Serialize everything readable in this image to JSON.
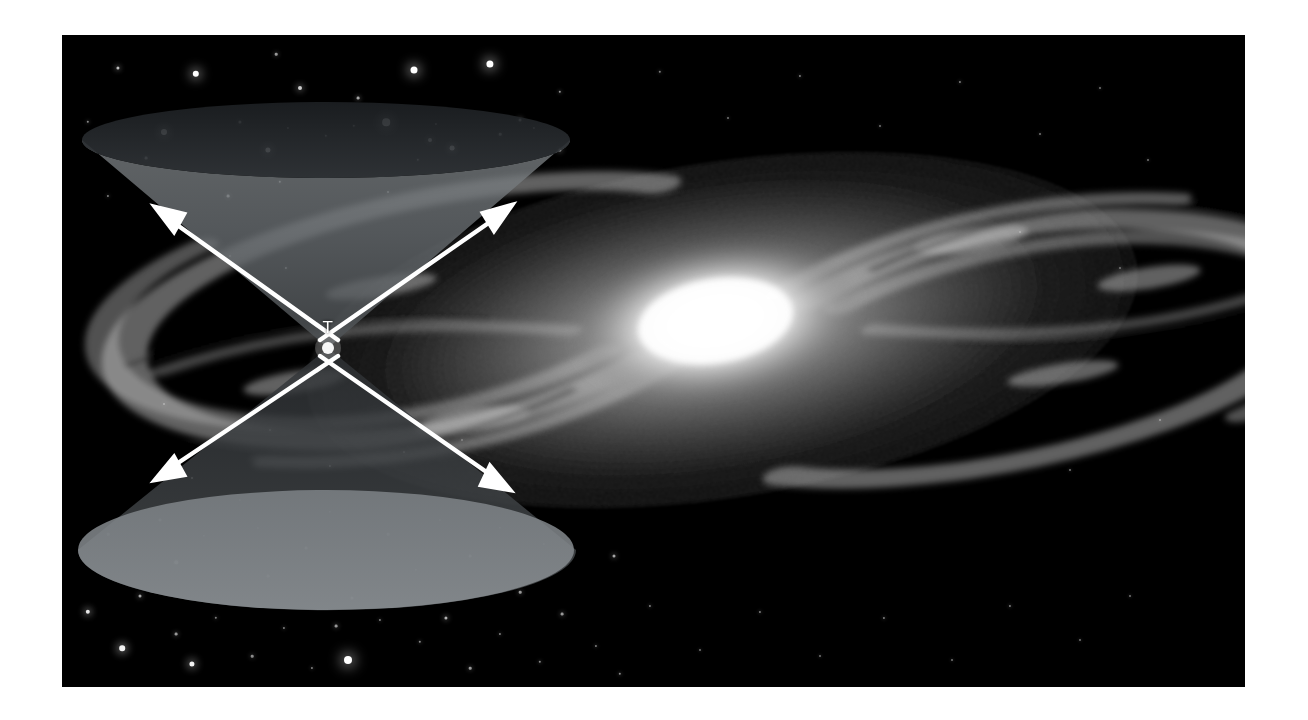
{
  "figure": {
    "kind": "astronomy-illustration",
    "background_color": "#ffffff",
    "plate_color": "#000000",
    "caption_text": "",
    "vertex_label": "T",
    "cone_label_color": "#ffffff",
    "plate": {
      "x": 62,
      "y": 35,
      "width": 1183,
      "height": 652
    }
  },
  "chart_data": {
    "type": "diagram",
    "subtitle": "",
    "xlabel": "",
    "ylabel": "",
    "grid": false,
    "legend_position": "none",
    "annotations": [
      {
        "text": "T",
        "x": 328,
        "y": 327,
        "role": "event-vertex-label"
      }
    ],
    "elements": [
      {
        "name": "future-light-cone",
        "kind": "cone",
        "orientation": "up",
        "apex": [
          328,
          348
        ],
        "rim_center": [
          326,
          140
        ],
        "rim_rx": 244,
        "rim_ry": 38,
        "wall_fill": "#6e7377",
        "interior_fill": "#2a2d31"
      },
      {
        "name": "past-light-cone",
        "kind": "cone",
        "orientation": "down",
        "apex": [
          328,
          348
        ],
        "rim_center": [
          326,
          550
        ],
        "rim_rx": 248,
        "rim_ry": 60,
        "wall_fill": "#3a3e42",
        "interior_fill": "#7b8085"
      },
      {
        "name": "spiral-galaxy",
        "kind": "spiral-galaxy",
        "center": [
          660,
          295
        ],
        "disk_rx": 460,
        "disk_ry": 175,
        "core_rx": 120,
        "core_ry": 62,
        "tilt_deg": -9,
        "arm_count": 4,
        "core_color": "#ffffff",
        "disk_color": "#b8b8b8"
      }
    ],
    "arrows": [
      {
        "name": "upper-left-ray",
        "from": [
          328,
          348
        ],
        "to": [
          155,
          207
        ],
        "color": "#ffffff"
      },
      {
        "name": "upper-right-ray",
        "from": [
          328,
          348
        ],
        "to": [
          510,
          205
        ],
        "color": "#ffffff"
      },
      {
        "name": "lower-left-ray",
        "from": [
          328,
          348
        ],
        "to": [
          155,
          478
        ],
        "color": "#ffffff"
      },
      {
        "name": "lower-right-ray",
        "from": [
          328,
          348
        ],
        "to": [
          508,
          490
        ],
        "color": "#ffffff"
      }
    ],
    "stars": [
      {
        "x": 118,
        "y": 68,
        "r": 1.6,
        "b": 0.75
      },
      {
        "x": 196,
        "y": 74,
        "r": 3.2,
        "b": 1.0
      },
      {
        "x": 276,
        "y": 54,
        "r": 1.3,
        "b": 0.6
      },
      {
        "x": 300,
        "y": 88,
        "r": 2.0,
        "b": 0.8
      },
      {
        "x": 358,
        "y": 98,
        "r": 1.4,
        "b": 0.65
      },
      {
        "x": 414,
        "y": 70,
        "r": 3.5,
        "b": 1.0
      },
      {
        "x": 430,
        "y": 140,
        "r": 2.0,
        "b": 0.8
      },
      {
        "x": 490,
        "y": 64,
        "r": 3.6,
        "b": 1.0
      },
      {
        "x": 520,
        "y": 120,
        "r": 1.5,
        "b": 0.7
      },
      {
        "x": 560,
        "y": 92,
        "r": 1.2,
        "b": 0.6
      },
      {
        "x": 88,
        "y": 122,
        "r": 1.2,
        "b": 0.55
      },
      {
        "x": 146,
        "y": 158,
        "r": 1.4,
        "b": 0.6
      },
      {
        "x": 164,
        "y": 132,
        "r": 3.0,
        "b": 1.0
      },
      {
        "x": 240,
        "y": 122,
        "r": 1.6,
        "b": 0.7
      },
      {
        "x": 268,
        "y": 150,
        "r": 2.6,
        "b": 0.95
      },
      {
        "x": 288,
        "y": 128,
        "r": 1.1,
        "b": 0.5
      },
      {
        "x": 326,
        "y": 136,
        "r": 1.2,
        "b": 0.55
      },
      {
        "x": 354,
        "y": 126,
        "r": 1.2,
        "b": 0.55
      },
      {
        "x": 386,
        "y": 122,
        "r": 3.8,
        "b": 1.0
      },
      {
        "x": 418,
        "y": 160,
        "r": 1.2,
        "b": 0.55
      },
      {
        "x": 436,
        "y": 124,
        "r": 1.1,
        "b": 0.5
      },
      {
        "x": 452,
        "y": 148,
        "r": 2.4,
        "b": 0.9
      },
      {
        "x": 500,
        "y": 134,
        "r": 1.3,
        "b": 0.6
      },
      {
        "x": 534,
        "y": 128,
        "r": 1.1,
        "b": 0.5
      },
      {
        "x": 560,
        "y": 150,
        "r": 1.6,
        "b": 0.7
      },
      {
        "x": 108,
        "y": 196,
        "r": 1.1,
        "b": 0.5
      },
      {
        "x": 228,
        "y": 196,
        "r": 1.4,
        "b": 0.6
      },
      {
        "x": 280,
        "y": 182,
        "r": 1.2,
        "b": 0.55
      },
      {
        "x": 388,
        "y": 192,
        "r": 1.0,
        "b": 0.45
      },
      {
        "x": 230,
        "y": 256,
        "r": 1.0,
        "b": 0.45
      },
      {
        "x": 286,
        "y": 268,
        "r": 1.1,
        "b": 0.5
      },
      {
        "x": 164,
        "y": 404,
        "r": 1.0,
        "b": 0.45
      },
      {
        "x": 270,
        "y": 430,
        "r": 1.0,
        "b": 0.45
      },
      {
        "x": 192,
        "y": 478,
        "r": 1.0,
        "b": 0.45
      },
      {
        "x": 240,
        "y": 500,
        "r": 1.1,
        "b": 0.5
      },
      {
        "x": 330,
        "y": 466,
        "r": 1.1,
        "b": 0.5
      },
      {
        "x": 404,
        "y": 452,
        "r": 1.0,
        "b": 0.45
      },
      {
        "x": 462,
        "y": 440,
        "r": 1.0,
        "b": 0.45
      },
      {
        "x": 108,
        "y": 534,
        "r": 1.3,
        "b": 0.6
      },
      {
        "x": 160,
        "y": 520,
        "r": 1.5,
        "b": 0.7
      },
      {
        "x": 176,
        "y": 562,
        "r": 1.8,
        "b": 0.8
      },
      {
        "x": 204,
        "y": 536,
        "r": 1.2,
        "b": 0.55
      },
      {
        "x": 258,
        "y": 528,
        "r": 1.1,
        "b": 0.5
      },
      {
        "x": 268,
        "y": 576,
        "r": 1.4,
        "b": 0.6
      },
      {
        "x": 306,
        "y": 548,
        "r": 1.4,
        "b": 0.65
      },
      {
        "x": 330,
        "y": 512,
        "r": 1.2,
        "b": 0.55
      },
      {
        "x": 352,
        "y": 598,
        "r": 1.6,
        "b": 0.7
      },
      {
        "x": 388,
        "y": 534,
        "r": 1.3,
        "b": 0.6
      },
      {
        "x": 416,
        "y": 570,
        "r": 1.2,
        "b": 0.55
      },
      {
        "x": 440,
        "y": 520,
        "r": 1.1,
        "b": 0.5
      },
      {
        "x": 470,
        "y": 556,
        "r": 1.4,
        "b": 0.65
      },
      {
        "x": 500,
        "y": 528,
        "r": 1.2,
        "b": 0.55
      },
      {
        "x": 520,
        "y": 592,
        "r": 1.3,
        "b": 0.6
      },
      {
        "x": 544,
        "y": 544,
        "r": 1.1,
        "b": 0.5
      },
      {
        "x": 88,
        "y": 612,
        "r": 2.2,
        "b": 0.9
      },
      {
        "x": 122,
        "y": 648,
        "r": 2.8,
        "b": 0.95
      },
      {
        "x": 140,
        "y": 596,
        "r": 1.5,
        "b": 0.65
      },
      {
        "x": 176,
        "y": 634,
        "r": 1.4,
        "b": 0.6
      },
      {
        "x": 192,
        "y": 664,
        "r": 2.6,
        "b": 0.95
      },
      {
        "x": 216,
        "y": 618,
        "r": 1.2,
        "b": 0.5
      },
      {
        "x": 252,
        "y": 656,
        "r": 1.3,
        "b": 0.55
      },
      {
        "x": 284,
        "y": 628,
        "r": 1.1,
        "b": 0.5
      },
      {
        "x": 312,
        "y": 668,
        "r": 1.1,
        "b": 0.5
      },
      {
        "x": 336,
        "y": 626,
        "r": 1.4,
        "b": 0.6
      },
      {
        "x": 348,
        "y": 660,
        "r": 4.0,
        "b": 1.0
      },
      {
        "x": 380,
        "y": 620,
        "r": 1.1,
        "b": 0.5
      },
      {
        "x": 420,
        "y": 642,
        "r": 1.2,
        "b": 0.55
      },
      {
        "x": 446,
        "y": 618,
        "r": 1.6,
        "b": 0.7
      },
      {
        "x": 470,
        "y": 668,
        "r": 1.3,
        "b": 0.6
      },
      {
        "x": 500,
        "y": 634,
        "r": 1.1,
        "b": 0.5
      },
      {
        "x": 540,
        "y": 662,
        "r": 1.2,
        "b": 0.55
      },
      {
        "x": 562,
        "y": 614,
        "r": 1.4,
        "b": 0.6
      },
      {
        "x": 596,
        "y": 646,
        "r": 1.1,
        "b": 0.5
      },
      {
        "x": 620,
        "y": 674,
        "r": 1.2,
        "b": 0.55
      },
      {
        "x": 614,
        "y": 556,
        "r": 1.5,
        "b": 0.65
      },
      {
        "x": 650,
        "y": 606,
        "r": 1.1,
        "b": 0.5
      },
      {
        "x": 700,
        "y": 650,
        "r": 1.0,
        "b": 0.45
      },
      {
        "x": 760,
        "y": 612,
        "r": 1.1,
        "b": 0.5
      },
      {
        "x": 820,
        "y": 656,
        "r": 1.0,
        "b": 0.45
      },
      {
        "x": 884,
        "y": 618,
        "r": 1.1,
        "b": 0.5
      },
      {
        "x": 952,
        "y": 660,
        "r": 1.0,
        "b": 0.45
      },
      {
        "x": 1010,
        "y": 606,
        "r": 1.1,
        "b": 0.5
      },
      {
        "x": 1080,
        "y": 640,
        "r": 1.0,
        "b": 0.45
      },
      {
        "x": 1130,
        "y": 596,
        "r": 1.0,
        "b": 0.45
      },
      {
        "x": 660,
        "y": 72,
        "r": 1.2,
        "b": 0.5
      },
      {
        "x": 728,
        "y": 118,
        "r": 1.0,
        "b": 0.45
      },
      {
        "x": 800,
        "y": 76,
        "r": 1.1,
        "b": 0.5
      },
      {
        "x": 880,
        "y": 126,
        "r": 1.0,
        "b": 0.45
      },
      {
        "x": 960,
        "y": 82,
        "r": 1.1,
        "b": 0.5
      },
      {
        "x": 1040,
        "y": 134,
        "r": 1.0,
        "b": 0.45
      },
      {
        "x": 1100,
        "y": 88,
        "r": 1.0,
        "b": 0.45
      },
      {
        "x": 1148,
        "y": 160,
        "r": 1.0,
        "b": 0.45
      },
      {
        "x": 1020,
        "y": 232,
        "r": 1.0,
        "b": 0.45
      },
      {
        "x": 1120,
        "y": 268,
        "r": 1.0,
        "b": 0.45
      },
      {
        "x": 1160,
        "y": 420,
        "r": 1.0,
        "b": 0.45
      },
      {
        "x": 1070,
        "y": 470,
        "r": 1.0,
        "b": 0.45
      }
    ]
  }
}
